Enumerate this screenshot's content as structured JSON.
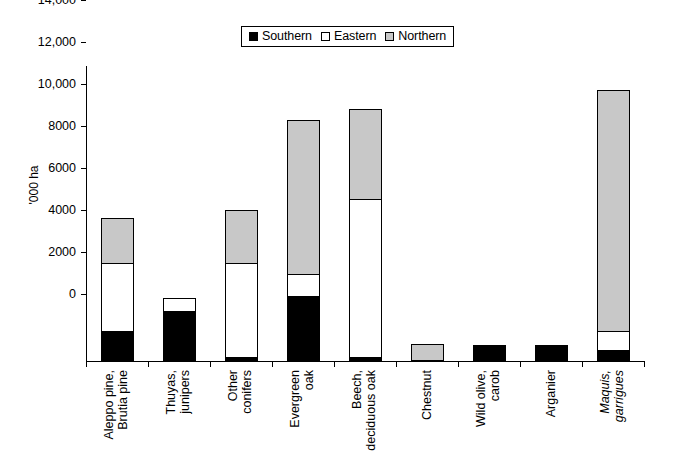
{
  "legend": {
    "entries": [
      {
        "label": "Southern",
        "color": "#000000",
        "key": "southern"
      },
      {
        "label": "Eastern",
        "color": "#ffffff",
        "key": "eastern"
      },
      {
        "label": "Northern",
        "color": "#c8c8c8",
        "key": "northern"
      }
    ]
  },
  "axes": {
    "y_title": "'000 ha",
    "y_ticks": [
      "0",
      "2000",
      "4000",
      "6000",
      "8000",
      "10,000",
      "12,000",
      "14,000"
    ]
  },
  "chart_data": {
    "type": "bar",
    "title": "",
    "xlabel": "",
    "ylabel": "'000 ha",
    "ylim": [
      0,
      14000
    ],
    "ytick_values": [
      0,
      2000,
      4000,
      6000,
      8000,
      10000,
      12000,
      14000
    ],
    "grid": false,
    "stacked": true,
    "legend_position": "top-center",
    "categories": [
      "Aleppo pine, Brutia pine",
      "Thuyas, junipers",
      "Other conifers",
      "Evergreen oak",
      "Beech, deciduous oak",
      "Chestnut",
      "Wild olive, carob",
      "Arganier",
      "Maquis, garrigues"
    ],
    "category_lines": [
      [
        "Aleppo pine,",
        "Brutia pine"
      ],
      [
        "Thuyas,",
        "junipers"
      ],
      [
        "Other",
        "conifers"
      ],
      [
        "Evergreen",
        "oak"
      ],
      [
        "Beech,",
        "deciduous oak"
      ],
      [
        "Chestnut",
        ""
      ],
      [
        "Wild olive,",
        "carob"
      ],
      [
        "Arganier",
        ""
      ],
      [
        "Maquis,",
        "garrigues"
      ]
    ],
    "category_italic": [
      false,
      false,
      false,
      false,
      false,
      false,
      false,
      false,
      true
    ],
    "series": [
      {
        "name": "Southern",
        "color": "#000000",
        "values": [
          1430,
          2380,
          190,
          3100,
          190,
          0,
          760,
          760,
          520
        ]
      },
      {
        "name": "Eastern",
        "color": "#ffffff",
        "values": [
          3290,
          670,
          4520,
          1100,
          7570,
          0,
          0,
          0,
          950
        ]
      },
      {
        "name": "Northern",
        "color": "#c8c8c8",
        "values": [
          2190,
          0,
          2570,
          7380,
          4330,
          810,
          0,
          0,
          11520
        ]
      }
    ],
    "totals": [
      6910,
      3050,
      7280,
      11580,
      12090,
      810,
      760,
      760,
      12990
    ]
  }
}
